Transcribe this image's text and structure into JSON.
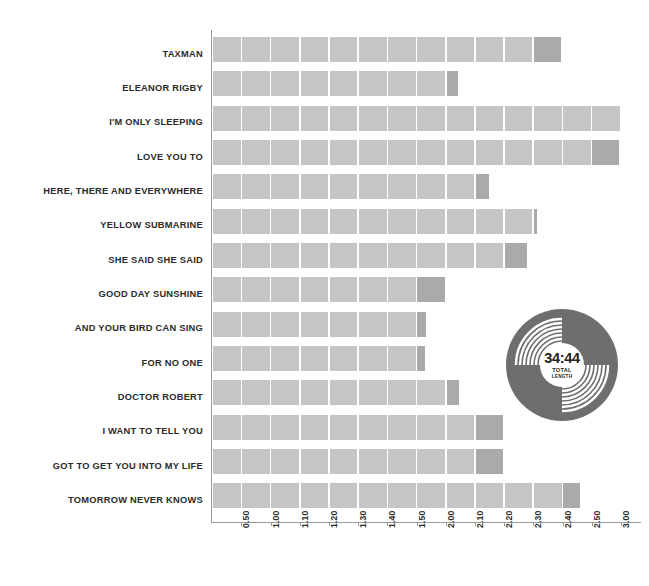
{
  "chart_data": {
    "type": "bar",
    "title": "",
    "subtitle": "",
    "xlabel": "",
    "ylabel": "",
    "orientation": "horizontal",
    "grid": false,
    "legend": false,
    "axis_tick_labels": [
      "0.50",
      "1.00",
      "1.10",
      "1.20",
      "1.30",
      "1.40",
      "1.50",
      "2.00",
      "2.10",
      "2.20",
      "2.30",
      "2.40",
      "2.50",
      "3.00",
      "3.10"
    ],
    "axis_unit": "minutes:seconds",
    "xlim": [
      "0.00",
      "3.10"
    ],
    "categories": [
      "TAXMAN",
      "ELEANOR RIGBY",
      "I'M ONLY SLEEPING",
      "LOVE YOU TO",
      "HERE, THERE AND EVERYWHERE",
      "YELLOW SUBMARINE",
      "SHE SAID SHE SAID",
      "GOOD DAY SUNSHINE",
      "AND YOUR BIRD CAN SING",
      "FOR NO ONE",
      "DOCTOR ROBERT",
      "I WANT TO TELL YOU",
      "GOT TO GET YOU INTO MY LIFE",
      "TOMORROW NEVER KNOWS"
    ],
    "values": [
      2.36,
      2.06,
      3.01,
      3.0,
      2.25,
      2.38,
      2.37,
      2.08,
      2.01,
      2.01,
      2.14,
      2.29,
      2.3,
      2.57
    ],
    "value_labels": [
      "2:36",
      "2:06",
      "3:01",
      "3:00",
      "2:25",
      "2:38",
      "2:37",
      "2:08",
      "2:01",
      "2:01",
      "2:14",
      "2:29",
      "2:30",
      "2:57"
    ],
    "bar_segments": [
      {
        "full": 11,
        "partial": 0.98
      },
      {
        "full": 8,
        "partial": 0.42
      },
      {
        "full": 14,
        "partial": 0.0
      },
      {
        "full": 13,
        "partial": 0.95
      },
      {
        "full": 9,
        "partial": 0.5
      },
      {
        "full": 11,
        "partial": 0.12
      },
      {
        "full": 10,
        "partial": 0.8
      },
      {
        "full": 7,
        "partial": 1.0
      },
      {
        "full": 7,
        "partial": 0.3
      },
      {
        "full": 7,
        "partial": 0.28
      },
      {
        "full": 8,
        "partial": 0.46
      },
      {
        "full": 9,
        "partial": 1.0
      },
      {
        "full": 9,
        "partial": 1.0
      },
      {
        "full": 12,
        "partial": 0.6
      }
    ]
  },
  "badge": {
    "total_length": "34:44",
    "caption_line1": "TOTAL",
    "caption_line2": "LENGTH"
  },
  "colors": {
    "bar_light": "#c5c5c5",
    "bar_partial": "#aaaaaa",
    "record_disc": "#6e6e6e",
    "record_label": "#ffffff",
    "axis": "#9a9a9a",
    "text": "#2b2b2b",
    "background": "#ffffff"
  }
}
